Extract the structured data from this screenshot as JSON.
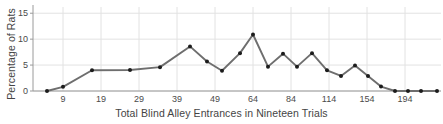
{
  "chart_data": {
    "type": "line",
    "title": "",
    "xlabel": "Total Blind Alley Entrances in Nineteen Trials",
    "ylabel": "Percentage of Rats",
    "ylim": [
      0,
      16.2
    ],
    "yticks": [
      0,
      5,
      10,
      15
    ],
    "ytick_labels": [
      "0",
      "5",
      "10",
      "15"
    ],
    "xticks": [
      9,
      19,
      29,
      39,
      49,
      64,
      84,
      114,
      154,
      194
    ],
    "xtick_labels": [
      "9",
      "19",
      "29",
      "39",
      "49",
      "64",
      "84",
      "114",
      "154",
      "194"
    ],
    "xtick_px": [
      63,
      101,
      139,
      177,
      215,
      253,
      291,
      329,
      367,
      405
    ],
    "grid": true,
    "grid_color": "#e2e2e2",
    "legend": "none",
    "line_color": "#6e6e6e",
    "marker_color": "#1c1c1c",
    "marker": "circle",
    "x_px": [
      47,
      63,
      92,
      130,
      160,
      190,
      207,
      222,
      240,
      253,
      268,
      283,
      297,
      312,
      327,
      341,
      355,
      368,
      381,
      395,
      408,
      421,
      437
    ],
    "values": [
      0.0,
      0.8,
      4.0,
      4.05,
      4.6,
      8.6,
      5.7,
      3.9,
      7.3,
      10.9,
      4.7,
      7.2,
      4.7,
      7.3,
      4.0,
      2.9,
      4.9,
      2.9,
      0.85,
      0.0,
      0.0,
      0.0,
      0.0
    ],
    "points": [
      {
        "y": 0.0
      },
      {
        "y": 0.8
      },
      {
        "y": 4.0
      },
      {
        "y": 4.05
      },
      {
        "y": 4.6
      },
      {
        "y": 8.6
      },
      {
        "y": 5.7
      },
      {
        "y": 3.9
      },
      {
        "y": 7.3
      },
      {
        "y": 10.9
      },
      {
        "y": 4.7
      },
      {
        "y": 7.2
      },
      {
        "y": 4.7
      },
      {
        "y": 7.3
      },
      {
        "y": 4.0
      },
      {
        "y": 2.9
      },
      {
        "y": 4.9
      },
      {
        "y": 2.9
      },
      {
        "y": 0.85
      },
      {
        "y": 0.0
      }
    ]
  },
  "axes": {
    "ylabel": "Percentage of Rats",
    "xlabel": "Total Blind Alley Entrances in Nineteen Trials"
  }
}
